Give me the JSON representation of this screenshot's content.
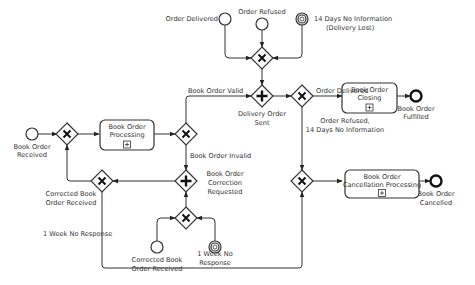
{
  "diagram": {
    "type": "BPMN process",
    "events": {
      "start_received": {
        "label": [
          "Book Order",
          "Received"
        ]
      },
      "order_delivered": {
        "label": [
          "Order Delivered"
        ]
      },
      "order_refused": {
        "label": [
          "Order Refused"
        ]
      },
      "timer_14_days": {
        "label": [
          "14 Days No Information",
          "(Delivery Lost)"
        ]
      },
      "end_fulfilled": {
        "label": [
          "Book Order",
          "Fulfilled"
        ]
      },
      "end_cancelled": {
        "label": [
          "Book Order",
          "Cancelled"
        ]
      },
      "corrected_received": {
        "label": [
          "Corrected Book",
          "Order Received"
        ]
      },
      "timer_1_week": {
        "label": [
          "1 Week No",
          "Response"
        ]
      }
    },
    "tasks": {
      "processing": {
        "label": [
          "Book Order",
          "Processing"
        ]
      },
      "closing": {
        "label": [
          "Book Order",
          "Closing"
        ]
      },
      "cancellation": {
        "label": [
          "Book Order",
          "Cancellation Processing"
        ]
      }
    },
    "gateways": {
      "delivery_sent": {
        "type": "parallel",
        "label": [
          "Delivery Order",
          "Sent"
        ]
      },
      "correction_requested": {
        "type": "parallel",
        "label": [
          "Book Order",
          "Correction",
          "Requested"
        ]
      },
      "corrected_merge": {
        "type": "exclusive",
        "label": [
          "Corrected Book",
          "Order Received"
        ]
      }
    },
    "flows": {
      "valid": "Book Order Valid",
      "invalid": "Book Order Invalid",
      "delivered": "Order Delivered",
      "refused": [
        "Order Refused,",
        "14 Days No Information"
      ],
      "no_response": "1 Week No Response"
    }
  }
}
